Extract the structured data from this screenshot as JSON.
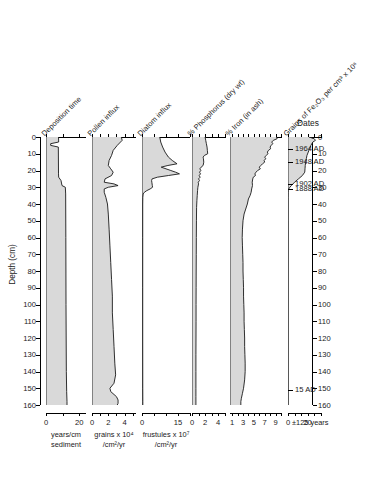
{
  "figure": {
    "depth_axis_label": "Depth (cm)",
    "dates_title": "Dates",
    "depth_ticks": [
      0,
      10,
      20,
      30,
      40,
      50,
      60,
      70,
      80,
      90,
      100,
      110,
      120,
      130,
      140,
      150,
      160
    ],
    "depth_min": 0,
    "depth_max": 160
  },
  "panels": [
    {
      "id": "deposition-time",
      "header": "Deposition time",
      "unit_line1": "years/cm",
      "unit_line2": "sediment",
      "tick_values": [
        0,
        10,
        20
      ],
      "tick_labels": [
        "0",
        "",
        "20"
      ],
      "x_min": 0,
      "x_max": 24,
      "profile": [
        [
          0,
          7.5
        ],
        [
          3,
          7.6
        ],
        [
          4,
          2.8
        ],
        [
          5,
          2.8
        ],
        [
          6,
          7.4
        ],
        [
          22,
          7.5
        ],
        [
          24,
          7.6
        ],
        [
          26,
          9.0
        ],
        [
          29,
          9.6
        ],
        [
          30,
          11.6
        ],
        [
          34,
          11.8
        ],
        [
          60,
          11.9
        ],
        [
          100,
          12.0
        ],
        [
          140,
          12.2
        ],
        [
          152,
          12.4
        ],
        [
          158,
          12.6
        ],
        [
          160,
          12.6
        ]
      ]
    },
    {
      "id": "pollen-influx",
      "header": "Pollen influx",
      "unit_line1": "grains x 10⁴",
      "unit_line2": "/cm²/yr",
      "tick_values": [
        0,
        1,
        2,
        3,
        4,
        5
      ],
      "tick_labels": [
        "0",
        "",
        "2",
        "",
        "4",
        ""
      ],
      "x_min": 0,
      "x_max": 5.4,
      "profile": [
        [
          0,
          3.6
        ],
        [
          2,
          3.7
        ],
        [
          5,
          3.1
        ],
        [
          8,
          2.6
        ],
        [
          11,
          2.4
        ],
        [
          14,
          2.1
        ],
        [
          17,
          2.0
        ],
        [
          19,
          2.3
        ],
        [
          21,
          2.6
        ],
        [
          23,
          2.4
        ],
        [
          25,
          1.6
        ],
        [
          27,
          1.5
        ],
        [
          28,
          2.7
        ],
        [
          29,
          3.2
        ],
        [
          30,
          2.0
        ],
        [
          31,
          1.5
        ],
        [
          33,
          1.5
        ],
        [
          36,
          1.7
        ],
        [
          40,
          1.9
        ],
        [
          46,
          2.0
        ],
        [
          55,
          2.1
        ],
        [
          65,
          2.2
        ],
        [
          75,
          2.3
        ],
        [
          85,
          2.4
        ],
        [
          95,
          2.5
        ],
        [
          105,
          2.5
        ],
        [
          115,
          2.6
        ],
        [
          125,
          2.7
        ],
        [
          135,
          2.8
        ],
        [
          142,
          2.9
        ],
        [
          147,
          2.7
        ],
        [
          150,
          2.2
        ],
        [
          152,
          2.3
        ],
        [
          155,
          3.0
        ],
        [
          157,
          3.2
        ],
        [
          159,
          3.2
        ],
        [
          160,
          3.1
        ]
      ]
    },
    {
      "id": "diatom-influx",
      "header": "Diatom influx",
      "unit_line1": "frustules x 10⁷",
      "unit_line2": "/cm²/yr",
      "tick_values": [
        0,
        5,
        10,
        15,
        20
      ],
      "tick_labels": [
        "0",
        "",
        "",
        "15",
        ""
      ],
      "x_min": 0,
      "x_max": 20,
      "profile": [
        [
          0,
          7.4
        ],
        [
          3,
          7.8
        ],
        [
          6,
          8.6
        ],
        [
          9,
          9.6
        ],
        [
          12,
          11.0
        ],
        [
          14,
          12.6
        ],
        [
          16,
          14.6
        ],
        [
          17,
          10.8
        ],
        [
          18,
          8.0
        ],
        [
          19,
          10.0
        ],
        [
          20,
          12.0
        ],
        [
          21,
          14.0
        ],
        [
          22,
          15.6
        ],
        [
          23,
          11.0
        ],
        [
          24,
          6.4
        ],
        [
          25,
          4.2
        ],
        [
          26,
          4.0
        ],
        [
          27,
          4.1
        ],
        [
          29,
          4.3
        ],
        [
          30,
          4.4
        ],
        [
          31,
          3.4
        ],
        [
          32,
          2.0
        ],
        [
          33,
          1.0
        ],
        [
          34,
          0.5
        ],
        [
          36,
          0.35
        ],
        [
          40,
          0.3
        ],
        [
          60,
          0.3
        ],
        [
          90,
          0.3
        ],
        [
          120,
          0.3
        ],
        [
          150,
          0.32
        ],
        [
          158,
          0.35
        ],
        [
          160,
          0.35
        ]
      ]
    },
    {
      "id": "phosphorus",
      "header": "% Phosphorus (dry wt)",
      "unit_line1": "",
      "unit_line2": "",
      "tick_values": [
        0,
        1,
        2,
        3,
        4,
        5
      ],
      "tick_labels": [
        "0",
        "",
        "2",
        "",
        "4",
        ""
      ],
      "x_min": 0,
      "x_max": 5.2,
      "profile": [
        [
          0,
          2.0
        ],
        [
          2,
          2.1
        ],
        [
          4,
          2.2
        ],
        [
          6,
          2.3
        ],
        [
          8,
          2.35
        ],
        [
          10,
          2.4
        ],
        [
          11,
          1.9
        ],
        [
          12,
          1.7
        ],
        [
          13,
          1.75
        ],
        [
          15,
          1.8
        ],
        [
          17,
          1.7
        ],
        [
          18,
          1.4
        ],
        [
          19,
          1.2
        ],
        [
          20,
          1.35
        ],
        [
          21,
          1.15
        ],
        [
          22,
          1.3
        ],
        [
          23,
          1.1
        ],
        [
          24,
          1.25
        ],
        [
          25,
          1.0
        ],
        [
          26,
          1.15
        ],
        [
          27,
          0.95
        ],
        [
          28,
          1.0
        ],
        [
          30,
          0.9
        ],
        [
          32,
          0.85
        ],
        [
          35,
          0.8
        ],
        [
          38,
          0.75
        ],
        [
          42,
          0.7
        ],
        [
          50,
          0.68
        ],
        [
          60,
          0.66
        ],
        [
          70,
          0.65
        ],
        [
          80,
          0.64
        ],
        [
          90,
          0.63
        ],
        [
          100,
          0.62
        ],
        [
          110,
          0.62
        ],
        [
          120,
          0.61
        ],
        [
          130,
          0.6
        ],
        [
          140,
          0.6
        ],
        [
          150,
          0.6
        ],
        [
          155,
          0.6
        ],
        [
          160,
          0.6
        ]
      ]
    },
    {
      "id": "iron",
      "header": "% Iron (in ash)",
      "unit_line1": "",
      "unit_line2": "",
      "tick_values": [
        1,
        2,
        3,
        4,
        5,
        6,
        7,
        8,
        9,
        10
      ],
      "tick_labels": [
        "1",
        "",
        "3",
        "",
        "5",
        "",
        "7",
        "",
        "9",
        ""
      ],
      "x_min": 0.6,
      "x_max": 10.2,
      "profile": [
        [
          0,
          9.2
        ],
        [
          1,
          9.3
        ],
        [
          2,
          8.6
        ],
        [
          3,
          8.3
        ],
        [
          4,
          8.5
        ],
        [
          5,
          8.2
        ],
        [
          6,
          8.0
        ],
        [
          7,
          8.1
        ],
        [
          8,
          7.7
        ],
        [
          9,
          7.5
        ],
        [
          10,
          7.6
        ],
        [
          11,
          7.3
        ],
        [
          12,
          7.0
        ],
        [
          13,
          7.2
        ],
        [
          14,
          6.9
        ],
        [
          15,
          7.0
        ],
        [
          16,
          6.6
        ],
        [
          17,
          6.3
        ],
        [
          18,
          6.0
        ],
        [
          19,
          6.2
        ],
        [
          20,
          5.7
        ],
        [
          21,
          5.4
        ],
        [
          22,
          5.2
        ],
        [
          23,
          5.3
        ],
        [
          24,
          4.9
        ],
        [
          25,
          4.8
        ],
        [
          27,
          4.7
        ],
        [
          29,
          4.75
        ],
        [
          31,
          4.6
        ],
        [
          33,
          4.5
        ],
        [
          35,
          4.3
        ],
        [
          37,
          4.0
        ],
        [
          40,
          3.8
        ],
        [
          43,
          3.5
        ],
        [
          46,
          3.2
        ],
        [
          50,
          3.0
        ],
        [
          55,
          2.9
        ],
        [
          60,
          2.85
        ],
        [
          65,
          2.9
        ],
        [
          70,
          2.95
        ],
        [
          75,
          3.0
        ],
        [
          80,
          3.0
        ],
        [
          85,
          3.05
        ],
        [
          90,
          3.1
        ],
        [
          95,
          3.1
        ],
        [
          100,
          3.15
        ],
        [
          105,
          3.2
        ],
        [
          110,
          3.2
        ],
        [
          115,
          3.25
        ],
        [
          120,
          3.3
        ],
        [
          125,
          3.3
        ],
        [
          130,
          3.35
        ],
        [
          135,
          3.4
        ],
        [
          140,
          3.4
        ],
        [
          145,
          3.3
        ],
        [
          150,
          3.1
        ],
        [
          153,
          2.9
        ],
        [
          156,
          2.7
        ],
        [
          158,
          2.6
        ],
        [
          160,
          2.6
        ]
      ]
    },
    {
      "id": "fe2o3-grains",
      "header": "Grains of Fe₂O₃ per cm³ x 10⁶",
      "unit_line1": "",
      "unit_line2": "",
      "tick_values": [
        0,
        5,
        10,
        15,
        20,
        25
      ],
      "tick_labels": [
        "0",
        "",
        "",
        "20",
        ""
      ],
      "x_min": 0,
      "x_max": 26,
      "profile": [
        [
          0,
          16.0
        ],
        [
          1,
          20.0
        ],
        [
          2,
          21.0
        ],
        [
          3,
          19.0
        ],
        [
          5,
          17.5
        ],
        [
          7,
          16.5
        ],
        [
          9,
          15.5
        ],
        [
          11,
          14.5
        ],
        [
          13,
          14.0
        ],
        [
          15,
          13.5
        ],
        [
          17,
          13.2
        ],
        [
          19,
          13.0
        ],
        [
          21,
          12.8
        ],
        [
          23,
          11.0
        ],
        [
          25,
          8.0
        ],
        [
          27,
          5.0
        ],
        [
          29,
          2.6
        ],
        [
          30,
          1.4
        ],
        [
          31,
          0.6
        ],
        [
          32,
          0.2
        ],
        [
          33,
          0.1
        ],
        [
          36,
          0.05
        ],
        [
          50,
          0.05
        ],
        [
          80,
          0.05
        ],
        [
          120,
          0.05
        ],
        [
          160,
          0.05
        ]
      ]
    }
  ],
  "dates": [
    {
      "label": "1964 AD",
      "depth": 7
    },
    {
      "label": "1948 AD",
      "depth": 15
    },
    {
      "label": "1902 AD",
      "depth": 28
    },
    {
      "label": "1888 AD",
      "depth": 31
    },
    {
      "label": "15 AD",
      "depth": 151
    }
  ],
  "date_error": "±125 years",
  "colors": {
    "fill": "#d9d9d9",
    "line": "#1a1a1a",
    "axis": "#000000"
  }
}
